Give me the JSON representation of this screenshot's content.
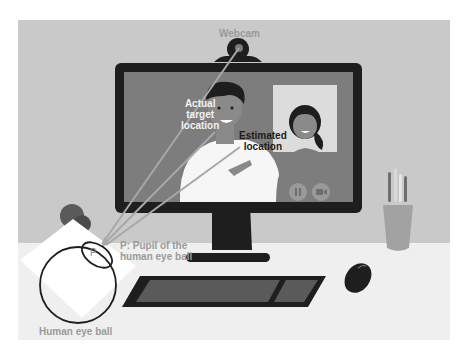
{
  "figure": {
    "type": "illustration",
    "colors": {
      "background_wall": "#c9c9c9",
      "desk": "#efefef",
      "monitor_frame": "#1e1e1e",
      "screen": "#7d7d7d",
      "gaze_lines": "#a8a8a8",
      "label_gray": "#9a9a9a",
      "label_white": "#f2f2f2",
      "label_dark": "#1c1c1c"
    }
  },
  "labels": {
    "webcam": "Webcam",
    "actual_target": [
      "Actual",
      "target",
      "location"
    ],
    "estimated": [
      "Estimated",
      "location"
    ],
    "pupil": [
      "P: Pupil of the",
      "human eye ball"
    ],
    "pupil_marker": "P",
    "eyeball": "Human eye ball"
  },
  "video_call": {
    "controls": [
      "pause-icon",
      "camera-off-icon"
    ]
  }
}
